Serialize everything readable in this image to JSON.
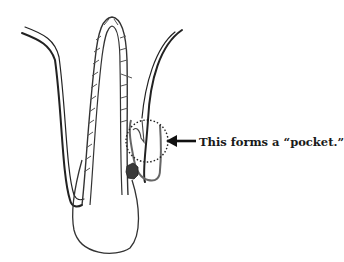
{
  "figure": {
    "annotation": "This forms a “pocket.”",
    "elements": [
      "gum-line-left",
      "hair-shaft",
      "follicle-bulb",
      "gum-line-right",
      "pocket-circle",
      "dark-deposit",
      "arrow"
    ],
    "colors": {
      "stroke": "#333333",
      "hatch": "#555555",
      "deposit": "#3a3a3a",
      "background": "#ffffff"
    }
  }
}
